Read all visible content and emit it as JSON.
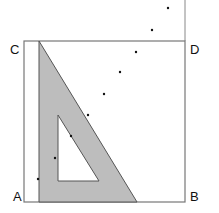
{
  "labels": {
    "A": "A",
    "B": "B",
    "C": "C",
    "D": "D"
  },
  "colors": {
    "triangle_fill": "#bdbdbd",
    "line": "#777777",
    "dot": "#111111"
  },
  "dots": [
    [
      168,
      8
    ],
    [
      152,
      30
    ],
    [
      136,
      52
    ],
    [
      120,
      72
    ],
    [
      104,
      94
    ],
    [
      88,
      115
    ],
    [
      71,
      136
    ],
    [
      55,
      158
    ],
    [
      38,
      179
    ]
  ]
}
